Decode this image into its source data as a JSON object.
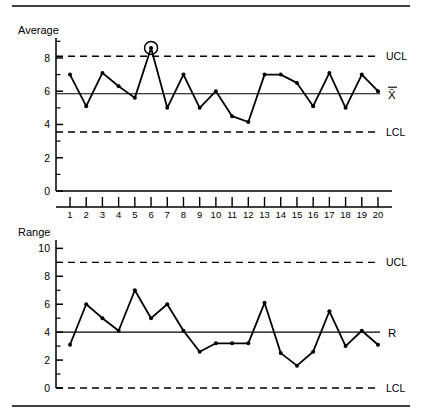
{
  "figure": {
    "title": "",
    "rules": {
      "top_rule": true,
      "bottom_rule": true
    }
  },
  "charts": [
    {
      "id": "xbar-chart",
      "name": "average-control-chart",
      "axis_title": "Average",
      "center_label": "X̄",
      "ucl_label": "UCL",
      "lcl_label": "LCL",
      "yticks": [
        "0",
        "2",
        "4",
        "6",
        "8"
      ],
      "ytick_values": [
        0,
        2,
        4,
        6,
        8
      ],
      "ylim": [
        0,
        9.2
      ],
      "ucl": 8.1,
      "center": 5.85,
      "lcl": 3.55,
      "out_of_control_samples": [
        6
      ]
    },
    {
      "id": "r-chart",
      "name": "range-control-chart",
      "axis_title": "Range",
      "center_label": "R",
      "ucl_label": "UCL",
      "lcl_label": "LCL",
      "yticks": [
        "0",
        "2",
        "4",
        "6",
        "8",
        "10"
      ],
      "ytick_values": [
        0,
        2,
        4,
        6,
        8,
        10
      ],
      "ylim": [
        0,
        10.6
      ],
      "ucl": 9.0,
      "center": 4.0,
      "lcl": 0.0,
      "out_of_control_samples": []
    }
  ],
  "xaxis": {
    "labels": [
      "1",
      "2",
      "3",
      "4",
      "5",
      "6",
      "7",
      "8",
      "9",
      "10",
      "11",
      "12",
      "13",
      "14",
      "15",
      "16",
      "17",
      "18",
      "19",
      "20"
    ],
    "min": 1,
    "max": 20
  },
  "chart_data": [
    {
      "type": "line",
      "id": "xbar",
      "title": "Average",
      "xlabel": "",
      "ylabel": "Average",
      "x": [
        1,
        2,
        3,
        4,
        5,
        6,
        7,
        8,
        9,
        10,
        11,
        12,
        13,
        14,
        15,
        16,
        17,
        18,
        19,
        20
      ],
      "categories": [
        "1",
        "2",
        "3",
        "4",
        "5",
        "6",
        "7",
        "8",
        "9",
        "10",
        "11",
        "12",
        "13",
        "14",
        "15",
        "16",
        "17",
        "18",
        "19",
        "20"
      ],
      "values": [
        7.0,
        5.1,
        7.1,
        6.3,
        5.6,
        8.6,
        5.0,
        7.0,
        5.0,
        6.0,
        4.5,
        4.15,
        7.0,
        7.0,
        6.5,
        5.1,
        7.1,
        5.0,
        7.0,
        6.0
      ],
      "ylim": [
        0,
        9.2
      ],
      "yticks": [
        0,
        2,
        4,
        6,
        8
      ],
      "grid": false,
      "legend": false,
      "control_limits": {
        "ucl": 8.1,
        "center": 5.85,
        "lcl": 3.55
      },
      "annotations": [
        {
          "type": "circle",
          "sample": 6,
          "value": 8.6,
          "note": "out of control point above UCL"
        }
      ]
    },
    {
      "type": "line",
      "id": "range",
      "title": "Range",
      "xlabel": "",
      "ylabel": "Range",
      "x": [
        1,
        2,
        3,
        4,
        5,
        6,
        7,
        8,
        9,
        10,
        11,
        12,
        13,
        14,
        15,
        16,
        17,
        18,
        19,
        20
      ],
      "categories": [
        "1",
        "2",
        "3",
        "4",
        "5",
        "6",
        "7",
        "8",
        "9",
        "10",
        "11",
        "12",
        "13",
        "14",
        "15",
        "16",
        "17",
        "18",
        "19",
        "20"
      ],
      "values": [
        3.1,
        6.0,
        5.0,
        4.1,
        7.0,
        5.0,
        6.0,
        4.1,
        2.6,
        3.2,
        3.2,
        3.2,
        6.1,
        2.5,
        1.6,
        2.6,
        5.5,
        3.0,
        4.1,
        3.1
      ],
      "ylim": [
        0,
        10.6
      ],
      "yticks": [
        0,
        2,
        4,
        6,
        8,
        10
      ],
      "grid": false,
      "legend": false,
      "control_limits": {
        "ucl": 9.0,
        "center": 4.0,
        "lcl": 0.0
      },
      "annotations": []
    }
  ]
}
